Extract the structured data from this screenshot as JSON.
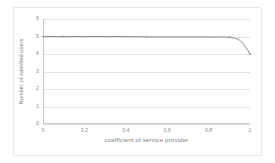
{
  "chart_data": {
    "type": "line",
    "title": "",
    "xlabel": "coefficient of service provider",
    "ylabel": "Number of satisfied users",
    "xlim": [
      0,
      1
    ],
    "ylim": [
      0,
      6
    ],
    "grid": true,
    "legend": false,
    "xticklabels": [
      "0",
      "0,2",
      "0,4",
      "0,6",
      "0,8",
      "1"
    ],
    "xtickvalues": [
      0,
      0.2,
      0.4,
      0.6,
      0.8,
      1
    ],
    "yticklabels": [
      "0",
      "1",
      "2",
      "3",
      "4",
      "5",
      "6"
    ],
    "ytickvalues": [
      0,
      1,
      2,
      3,
      4,
      5,
      6
    ],
    "line_color": "#8c8c96",
    "series": [
      {
        "name": "satisfied users",
        "x": [
          0,
          0.1,
          0.2,
          0.3,
          0.4,
          0.5,
          0.6,
          0.7,
          0.8,
          0.9,
          0.93,
          0.95,
          0.97,
          0.99,
          1
        ],
        "values": [
          5.0,
          5.0,
          5.0,
          5.0,
          5.0,
          4.98,
          4.98,
          4.98,
          4.98,
          4.97,
          4.9,
          4.78,
          4.55,
          4.2,
          4.0
        ]
      }
    ]
  }
}
